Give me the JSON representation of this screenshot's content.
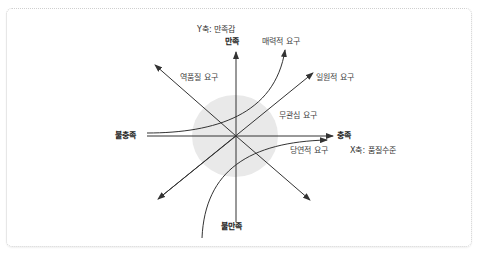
{
  "diagram": {
    "type": "kano-model",
    "axes": {
      "y": {
        "title": "Y축: 만족감",
        "top_label": "만족",
        "bottom_label": "불만족"
      },
      "x": {
        "title": "X축: 품질수준",
        "right_label": "충족",
        "left_label": "불충족"
      }
    },
    "curves": [
      {
        "name": "매력적 요구",
        "shape": "convex-up curve, left to top"
      },
      {
        "name": "일원적 요구",
        "shape": "diagonal line, lower-left to upper-right"
      },
      {
        "name": "무관심 요구",
        "shape": "neutral zone circle at origin"
      },
      {
        "name": "당연적 요구",
        "shape": "concave curve, bottom to right"
      },
      {
        "name": "역품질 요구",
        "shape": "diagonal line, lower-right to upper-left"
      }
    ],
    "colors": {
      "line": "#333333",
      "indifferent_zone": "#e8e8e8",
      "border": "#cfcfcf"
    }
  }
}
